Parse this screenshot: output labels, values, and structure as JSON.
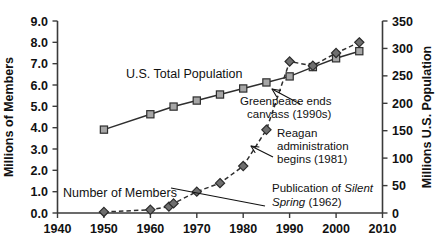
{
  "chart_data": {
    "type": "line",
    "title": "",
    "xlabel": "",
    "xlim": [
      1940,
      2010
    ],
    "xticks": [
      1940,
      1950,
      1960,
      1970,
      1980,
      1990,
      2000,
      2010
    ],
    "grid": false,
    "legend": "inline-labels",
    "axes": {
      "left": {
        "label": "Millions of Members",
        "lim": [
          0.0,
          9.0
        ],
        "ticks": [
          "0.0",
          "1.0",
          "2.0",
          "3.0",
          "4.0",
          "5.0",
          "6.0",
          "7.0",
          "8.0",
          "9.0"
        ]
      },
      "right": {
        "label": "Millions U.S. Population",
        "lim": [
          0,
          350
        ],
        "ticks": [
          "0",
          "50",
          "100",
          "150",
          "200",
          "250",
          "300",
          "350"
        ]
      }
    },
    "series": [
      {
        "name": "U.S. Total Population",
        "axis": "right",
        "marker": "square",
        "linestyle": "solid",
        "x": [
          1950,
          1960,
          1965,
          1970,
          1975,
          1980,
          1985,
          1990,
          1995,
          2000,
          2005
        ],
        "values": [
          152,
          180,
          194,
          205,
          216,
          227,
          238,
          249,
          266,
          282,
          295
        ]
      },
      {
        "name": "Number of Members",
        "axis": "left",
        "marker": "diamond",
        "linestyle": "dashed",
        "x": [
          1950,
          1960,
          1964,
          1965,
          1970,
          1975,
          1980,
          1985,
          1990,
          1995,
          2000,
          2005
        ],
        "values": [
          0.05,
          0.15,
          0.3,
          0.45,
          1.0,
          1.4,
          2.2,
          3.9,
          7.1,
          6.9,
          7.5,
          8.0
        ]
      }
    ],
    "annotations": [
      {
        "id": "greenpeace",
        "line1": "Greenpeace ends",
        "line2": "canvass (1990s)",
        "target_x": 1990,
        "target_series": "U.S. Total Population"
      },
      {
        "id": "reagan",
        "line1": "Reagan",
        "line2": "administration",
        "line3": "begins (1981)",
        "target_x": 1981,
        "target_series": "Number of Members"
      },
      {
        "id": "silent-spring",
        "prefix": "Publication of ",
        "italic1": "Silent",
        "italic2": "Spring",
        "suffix": " (1962)",
        "target_x": 1962,
        "target_series": "Number of Members"
      }
    ],
    "series_labels": [
      {
        "text": "U.S. Total Population"
      },
      {
        "text": "Number of Members"
      }
    ]
  },
  "colors": {
    "square_marker": "#a6a6a6",
    "diamond_marker": "#6e6e6e",
    "line": "#2e2e2e",
    "text": "#111111",
    "background": "#ffffff"
  }
}
